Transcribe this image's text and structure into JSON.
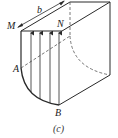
{
  "diagram": {
    "type": "hydrostatic-curved-surface",
    "labels": {
      "M": "M",
      "N": "N",
      "A": "A",
      "B": "B",
      "b": "b"
    },
    "caption": "(c)",
    "colors": {
      "stroke": "#2a2a2a",
      "dashed": "#555555",
      "background": "#ffffff"
    },
    "pressure_arrows_count": 4
  }
}
